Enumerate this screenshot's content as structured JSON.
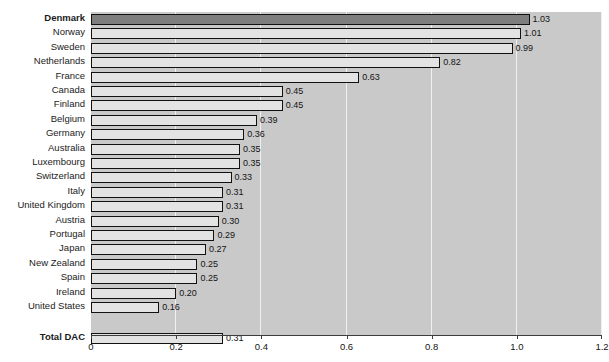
{
  "chart_data": {
    "type": "bar",
    "orientation": "horizontal",
    "title": "As % of GNI",
    "xlabel": "",
    "ylabel": "",
    "xlim": [
      0,
      1.2
    ],
    "grid": true,
    "legend": "none",
    "xticks": [
      "0",
      "0.2",
      "0.4",
      "0.6",
      "0.8",
      "1.0",
      "1.2"
    ],
    "xtick_values": [
      0,
      0.2,
      0.4,
      0.6,
      0.8,
      1.0,
      1.2
    ],
    "categories": [
      "Denmark",
      "Norway",
      "Sweden",
      "Netherlands",
      "France",
      "Canada",
      "Finland",
      "Belgium",
      "Germany",
      "Australia",
      "Luxembourg",
      "Switzerland",
      "Italy",
      "United Kingdom",
      "Austria",
      "Portugal",
      "Japan",
      "New Zealand",
      "Spain",
      "Ireland",
      "United States",
      "Total DAC"
    ],
    "values": [
      1.03,
      1.01,
      0.99,
      0.82,
      0.63,
      0.45,
      0.45,
      0.39,
      0.36,
      0.35,
      0.35,
      0.33,
      0.31,
      0.31,
      0.3,
      0.29,
      0.27,
      0.25,
      0.25,
      0.2,
      0.16,
      0.31
    ],
    "value_labels": [
      "1.03",
      "1.01",
      "0.99",
      "0.82",
      "0.63",
      "0.45",
      "0.45",
      "0.39",
      "0.36",
      "0.35",
      "0.35",
      "0.33",
      "0.31",
      "0.31",
      "0.30",
      "0.29",
      "0.27",
      "0.25",
      "0.25",
      "0.20",
      "0.16",
      "0.31"
    ],
    "bold_categories": [
      "Denmark",
      "Total DAC"
    ],
    "highlight_categories": [
      "Denmark"
    ],
    "separated_after_index": 20,
    "colors": {
      "plot_background": "#c9c9c9",
      "page_background": "#ffffff",
      "bar_fill": "#e3e3e3",
      "bar_highlight_fill": "#7e7e7e",
      "bar_border": "#111111",
      "gridline": "#f0f0f0",
      "axis": "#3d3d3d",
      "text": "#141414"
    }
  }
}
